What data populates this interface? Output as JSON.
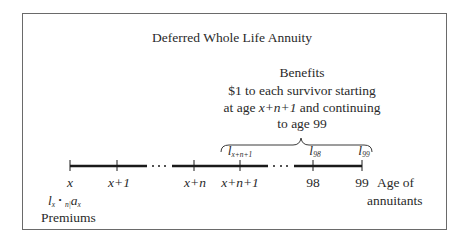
{
  "title": "Deferred Whole Life Annuity",
  "benefits": {
    "heading": "Benefits",
    "lines": [
      "$1 to each survivor starting",
      "at age ",
      "and continuing",
      "to age 99"
    ],
    "start_age_expr": "x+n+1"
  },
  "timeline": {
    "ticks": [
      {
        "label": "x",
        "italic": true
      },
      {
        "label": "x+1",
        "italic": true
      },
      {
        "label": "x+n",
        "italic": true
      },
      {
        "label": "x+n+1",
        "italic": true
      },
      {
        "label": "98",
        "italic": false
      },
      {
        "label": "99",
        "italic": false
      }
    ],
    "ellipsis": "· · ·",
    "axis_label_line1": "Age of",
    "axis_label_line2": "annuitants"
  },
  "survivors": {
    "l_base": "l",
    "items": [
      {
        "sub": "x+n+1"
      },
      {
        "sub": "98"
      },
      {
        "sub": "99"
      }
    ]
  },
  "premiums": {
    "expr_l": "l",
    "expr_l_sub": "x",
    "expr_dot": "•",
    "expr_pre_sub": "n|",
    "expr_a": "a",
    "expr_a_sub": "x",
    "label": "Premiums"
  }
}
